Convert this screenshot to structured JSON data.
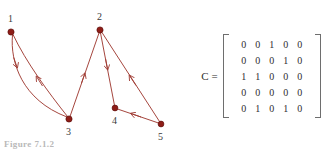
{
  "figure": {
    "caption": "Figure 7.1.2",
    "colors": {
      "edge": "#a03c34",
      "node_fill": "#8f1d17",
      "node_stroke": "#5e0f0c",
      "label_text": "#3a3a3a",
      "matrix_text": "#2e2e2e",
      "bracket": "#6e6e6e",
      "background": "#ffffff"
    }
  },
  "graph": {
    "type": "directed-graph",
    "nodes": [
      {
        "id": "1",
        "label": "1",
        "x": 11,
        "y": 32,
        "label_x": 8,
        "label_y": 14,
        "r": 3.1
      },
      {
        "id": "2",
        "label": "2",
        "x": 100,
        "y": 30,
        "label_x": 97,
        "label_y": 12,
        "r": 3.1
      },
      {
        "id": "3",
        "label": "3",
        "x": 69,
        "y": 119,
        "label_x": 66,
        "label_y": 127,
        "r": 3.1
      },
      {
        "id": "4",
        "label": "4",
        "x": 115,
        "y": 108,
        "label_x": 112,
        "label_y": 116,
        "r": 2.9
      },
      {
        "id": "5",
        "label": "5",
        "x": 161,
        "y": 124,
        "label_x": 158,
        "label_y": 132,
        "r": 2.9
      }
    ],
    "edges": [
      {
        "from": "1",
        "to": "3",
        "style": "curve-left",
        "arrow_at": "0.45"
      },
      {
        "from": "3",
        "to": "1",
        "style": "curve-right",
        "arrow_at": "0.55"
      },
      {
        "from": "3",
        "to": "2",
        "style": "straight",
        "arrow_at": "0.55"
      },
      {
        "from": "2",
        "to": "4",
        "style": "straight",
        "arrow_at": "0.52"
      },
      {
        "from": "5",
        "to": "2",
        "style": "straight",
        "arrow_at": "0.55"
      },
      {
        "from": "5",
        "to": "4",
        "style": "straight",
        "arrow_at": "0.55"
      }
    ]
  },
  "matrix": {
    "name": "C =",
    "rows": 5,
    "cols": 5,
    "values": [
      [
        "0",
        "0",
        "1",
        "0",
        "0"
      ],
      [
        "0",
        "0",
        "0",
        "1",
        "0"
      ],
      [
        "1",
        "1",
        "0",
        "0",
        "0"
      ],
      [
        "0",
        "0",
        "0",
        "0",
        "0"
      ],
      [
        "0",
        "1",
        "0",
        "1",
        "0"
      ]
    ]
  }
}
